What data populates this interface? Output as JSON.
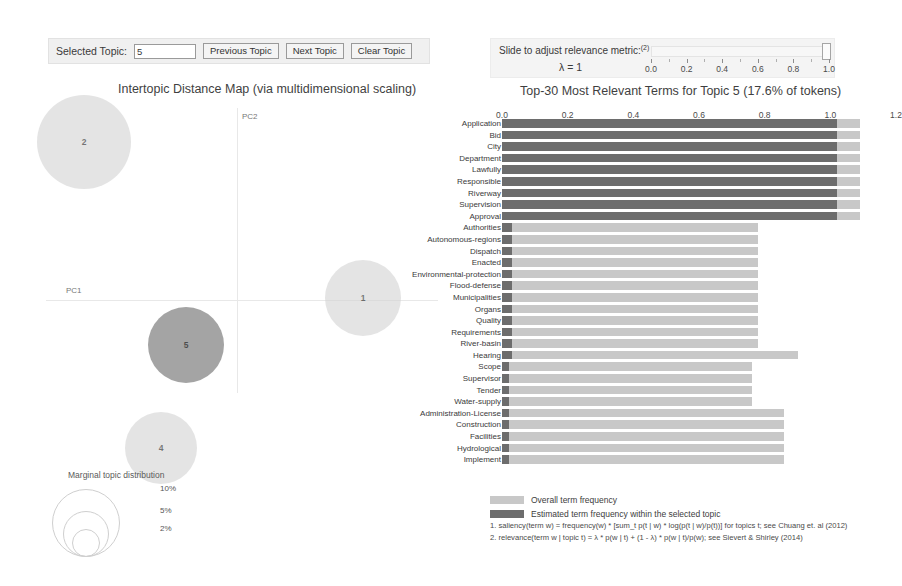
{
  "toolbar": {
    "selected_topic_label": "Selected Topic:",
    "selected_topic_value": "5",
    "previous_topic_label": "Previous Topic",
    "next_topic_label": "Next Topic",
    "clear_topic_label": "Clear Topic"
  },
  "slider": {
    "caption": "Slide to adjust relevance metric:",
    "caption_superscript": "(2)",
    "lambda_label": "λ = 1",
    "value": 1.0,
    "ticks": [
      "0.0",
      "0.2",
      "0.4",
      "0.6",
      "0.8",
      "1.0"
    ]
  },
  "intertopic": {
    "title": "Intertopic Distance Map (via multidimensional scaling)",
    "axis_x_label": "PC1",
    "axis_y_label": "PC2",
    "marginal_title": "Marginal topic distribution",
    "marginal_sizes": [
      "2%",
      "5%",
      "10%"
    ],
    "topics": [
      {
        "id": "2",
        "x": 48,
        "y": 42,
        "r": 47,
        "selected": false
      },
      {
        "id": "1",
        "x": 327,
        "y": 198,
        "r": 38,
        "selected": false
      },
      {
        "id": "5",
        "x": 150,
        "y": 245,
        "r": 38,
        "selected": true
      },
      {
        "id": "4",
        "x": 125,
        "y": 348,
        "r": 36,
        "selected": false
      }
    ]
  },
  "chart_data": {
    "type": "bar",
    "title": "Top-30 Most Relevant Terms for Topic 5 (17.6% of tokens)",
    "xlabel": "",
    "ylabel": "",
    "xlim": [
      0.0,
      1.2
    ],
    "xticks": [
      "0.0",
      "0.2",
      "0.4",
      "0.6",
      "0.8",
      "1.0",
      "1.2"
    ],
    "grid": false,
    "legend_position": "bottom",
    "orientation": "horizontal",
    "topic": 5,
    "topic_token_share": "17.6%",
    "categories": [
      "Application",
      "Bid",
      "City",
      "Department",
      "Lawfully",
      "Responsible",
      "Riverway",
      "Supervision",
      "Approval",
      "Authorities",
      "Autonomous-regions",
      "Dispatch",
      "Enacted",
      "Environmental-protection",
      "Flood-defense",
      "Municipalities",
      "Organs",
      "Quality",
      "Requirements",
      "River-basin",
      "Hearing",
      "Scope",
      "Supervisor",
      "Tender",
      "Water-supply",
      "Administration-License",
      "Construction",
      "Facilities",
      "Hydrological",
      "Implement"
    ],
    "series": [
      {
        "name": "Overall term frequency",
        "color": "#c8c8c8",
        "values": [
          1.09,
          1.09,
          1.09,
          1.09,
          1.09,
          1.09,
          1.09,
          1.09,
          1.09,
          0.78,
          0.78,
          0.78,
          0.78,
          0.78,
          0.78,
          0.78,
          0.78,
          0.78,
          0.78,
          0.78,
          0.9,
          0.76,
          0.76,
          0.76,
          0.76,
          0.86,
          0.86,
          0.86,
          0.86,
          0.86
        ]
      },
      {
        "name": "Estimated term frequency within the selected topic",
        "color": "#6d6d6d",
        "values": [
          1.02,
          1.02,
          1.02,
          1.02,
          1.02,
          1.02,
          1.02,
          1.02,
          1.02,
          0.03,
          0.03,
          0.03,
          0.03,
          0.03,
          0.03,
          0.03,
          0.03,
          0.03,
          0.03,
          0.03,
          0.03,
          0.02,
          0.02,
          0.02,
          0.02,
          0.02,
          0.02,
          0.02,
          0.02,
          0.02
        ]
      }
    ]
  },
  "legend": {
    "overall_label": "Overall term frequency",
    "estimated_label": "Estimated term frequency within the selected topic"
  },
  "footnotes": [
    "1. saliency(term w) = frequency(w) * [sum_t p(t | w) * log(p(t | w)/p(t))] for topics t; see Chuang et. al (2012)",
    "2. relevance(term w | topic t) = λ * p(w | t) + (1 - λ) * p(w | t)/p(w); see Sievert & Shirley (2014)"
  ]
}
